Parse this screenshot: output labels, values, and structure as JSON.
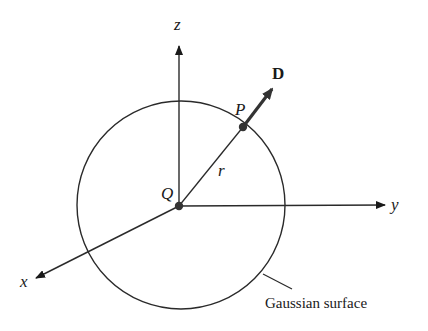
{
  "diagram": {
    "axes": {
      "z_label": "z",
      "y_label": "y",
      "x_label": "x"
    },
    "charge": {
      "label": "Q"
    },
    "point": {
      "label": "P"
    },
    "radius": {
      "label": "r"
    },
    "vector": {
      "label": "D"
    },
    "surface": {
      "label": "Gaussian surface"
    },
    "colors": {
      "line": "#2a2a2a",
      "background": "#ffffff"
    }
  }
}
